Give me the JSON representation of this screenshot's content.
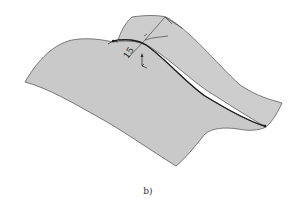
{
  "figure": {
    "caption": "b)",
    "dimension_label": "15",
    "colors": {
      "surface_fill": "#c9c9c9",
      "surface_back_fill": "#cdcdcd",
      "surface_edge": "#4a4a4a",
      "curve": "#1e1e1e",
      "annotation": "#333333",
      "background": "#ffffff"
    },
    "elements": [
      {
        "name": "curved-surface",
        "description": "3D swept gray surface"
      },
      {
        "name": "guide-curve",
        "description": "dark curve along the surface crest"
      },
      {
        "name": "dimension-annotation",
        "description": "linear dimension labeled 15"
      },
      {
        "name": "coordinate-triad",
        "description": "small axis indicator"
      }
    ]
  }
}
